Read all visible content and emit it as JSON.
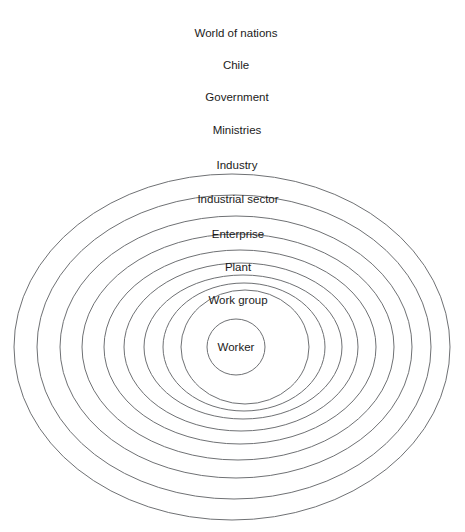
{
  "figure": {
    "type": "concentric-ellipse-diagram",
    "background_color": "#ffffff",
    "stroke_color": "#6f7174",
    "text_color": "#1b1b1b",
    "top_clipped_artifact": "",
    "levels": [
      {
        "index": 1,
        "label": "World of nations",
        "cx": 232,
        "cy": 347,
        "rx": 218,
        "ry": 173,
        "label_x": 236,
        "label_y": 37
      },
      {
        "index": 2,
        "label": "Chile",
        "cx": 234,
        "cy": 347,
        "rx": 197,
        "ry": 152,
        "label_x": 236,
        "label_y": 69
      },
      {
        "index": 3,
        "label": "Government",
        "cx": 236,
        "cy": 347,
        "rx": 176,
        "ry": 131,
        "label_x": 237,
        "label_y": 101
      },
      {
        "index": 4,
        "label": "Ministries",
        "cx": 238,
        "cy": 347,
        "rx": 156,
        "ry": 113,
        "label_x": 237,
        "label_y": 134
      },
      {
        "index": 5,
        "label": "Industry",
        "cx": 240,
        "cy": 347,
        "rx": 136,
        "ry": 97,
        "label_x": 237,
        "label_y": 169
      },
      {
        "index": 6,
        "label": "Industrial sector",
        "cx": 241,
        "cy": 347,
        "rx": 117,
        "ry": 84,
        "label_x": 238,
        "label_y": 203
      },
      {
        "index": 7,
        "label": "Enterprise",
        "cx": 243,
        "cy": 347,
        "rx": 99,
        "ry": 72,
        "label_x": 238,
        "label_y": 238
      },
      {
        "index": 8,
        "label": "Plant",
        "cx": 244,
        "cy": 347,
        "rx": 81,
        "ry": 64,
        "label_x": 238,
        "label_y": 271
      },
      {
        "index": 9,
        "label": "Work group",
        "cx": 245,
        "cy": 347,
        "rx": 64,
        "ry": 57,
        "label_x": 238,
        "label_y": 304
      },
      {
        "index": 10,
        "label": "Worker",
        "cx": 236,
        "cy": 347,
        "rx": 29,
        "ry": 28,
        "label_x": 236,
        "label_y": 351
      }
    ]
  }
}
